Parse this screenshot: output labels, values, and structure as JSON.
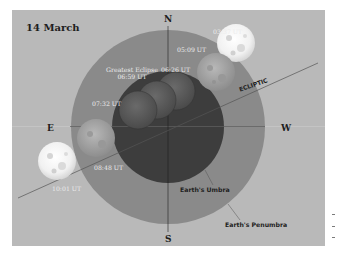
{
  "title": "14 March",
  "cardinal": {
    "north": "N",
    "south": "S",
    "east": "E",
    "west": "W"
  },
  "ecliptic_label": "ECLIPTIC",
  "regions": {
    "umbra_label": "Earth's Umbra",
    "penumbra_label": "Earth's Penumbra"
  },
  "greatest_eclipse": {
    "label": "Greatest Eclipse",
    "time": "06:59 UT"
  },
  "moon_positions": [
    {
      "time": "03:37 UT",
      "phase": "before penumbra"
    },
    {
      "time": "05:09 UT",
      "phase": "penumbral"
    },
    {
      "time": "06:26 UT",
      "phase": "umbral"
    },
    {
      "time": "06:59 UT",
      "phase": "greatest eclipse"
    },
    {
      "time": "07:32 UT",
      "phase": "umbral"
    },
    {
      "time": "08:48 UT",
      "phase": "penumbral"
    },
    {
      "time": "10:01 UT",
      "phase": "after penumbra"
    }
  ],
  "colors": {
    "background": "#b9b9b9",
    "penumbra": "#8a8a8a",
    "umbra": "#3d3d3d",
    "text_dark": "#1e1e1e",
    "text_light": "#ececec"
  }
}
